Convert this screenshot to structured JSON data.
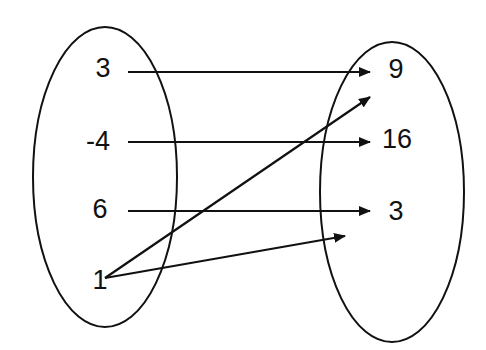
{
  "diagram": {
    "type": "mapping",
    "domain_set": {
      "label": "domain",
      "elements": [
        {
          "value": "3",
          "x": 103,
          "y": 77
        },
        {
          "value": "-4",
          "x": 98,
          "y": 150
        },
        {
          "value": "6",
          "x": 100,
          "y": 218
        },
        {
          "value": "1",
          "x": 102,
          "y": 289
        }
      ]
    },
    "range_set": {
      "label": "range",
      "elements": [
        {
          "value": "9",
          "x": 396,
          "y": 78
        },
        {
          "value": "16",
          "x": 397,
          "y": 148
        },
        {
          "value": "3",
          "x": 396,
          "y": 220
        }
      ]
    },
    "mappings": [
      {
        "from": "3",
        "to": "9"
      },
      {
        "from": "-4",
        "to": "16"
      },
      {
        "from": "6",
        "to": "3"
      },
      {
        "from": "1",
        "to": "between 9 and 16 (toward 9)"
      },
      {
        "from": "1",
        "to": "below 3"
      }
    ],
    "colors": {
      "stroke": "#111111",
      "background": "#ffffff"
    }
  }
}
